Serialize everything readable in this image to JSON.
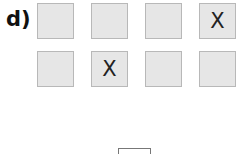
{
  "exercise": {
    "label": "d)",
    "rows": [
      [
        {
          "mark": ""
        },
        {
          "mark": ""
        },
        {
          "mark": ""
        },
        {
          "mark": "X"
        }
      ],
      [
        {
          "mark": ""
        },
        {
          "mark": "X"
        },
        {
          "mark": ""
        },
        {
          "mark": ""
        }
      ]
    ],
    "colors": {
      "box_fill": "#e6e6e6",
      "box_border": "#b8b8b8",
      "text": "#222222"
    }
  },
  "answer_box": {
    "value": ""
  }
}
